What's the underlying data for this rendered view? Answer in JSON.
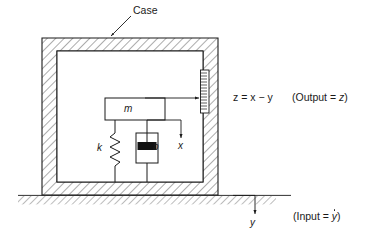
{
  "figure": {
    "labels": {
      "case": "Case",
      "mass": "m",
      "spring": "k",
      "damper": "b",
      "mass_displacement": "x",
      "base_displacement": "y"
    },
    "annotations": {
      "output_equation": "z = x − y",
      "output_note_open": "(Output = ",
      "output_note_var": "z",
      "output_note_close": ")",
      "input_note_open": "(Input = ",
      "input_note_var": "y",
      "input_note_close": ")"
    },
    "colors": {
      "stroke": "#1a1a1a",
      "hatch": "#555555",
      "piston_fill": "#111111",
      "background": "#ffffff"
    },
    "components": [
      {
        "name": "case-wall",
        "kind": "hatched-enclosure"
      },
      {
        "name": "ground",
        "kind": "hatched-strip"
      },
      {
        "name": "mass-block",
        "kind": "rectangle"
      },
      {
        "name": "spring",
        "kind": "zigzag",
        "coils": 5
      },
      {
        "name": "damper",
        "kind": "dashpot"
      },
      {
        "name": "scale-ruler",
        "kind": "ticked-strip",
        "ticks": 14
      }
    ]
  }
}
